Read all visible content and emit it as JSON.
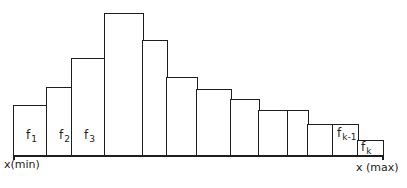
{
  "diagram": {
    "type": "histogram",
    "axis": {
      "left_label": "x(min)",
      "right_label": "x (max)"
    },
    "bars": [
      {
        "x0": 13,
        "x1": 46,
        "top": 105,
        "label": "f",
        "sub": "1"
      },
      {
        "x0": 46,
        "x1": 71,
        "top": 87,
        "label": "f",
        "sub": "2"
      },
      {
        "x0": 71,
        "x1": 104,
        "top": 58,
        "label": "f",
        "sub": "3"
      },
      {
        "x0": 104,
        "x1": 142,
        "top": 13,
        "label": "",
        "sub": ""
      },
      {
        "x0": 142,
        "x1": 166,
        "top": 40,
        "label": "",
        "sub": ""
      },
      {
        "x0": 166,
        "x1": 196,
        "top": 77,
        "label": "",
        "sub": ""
      },
      {
        "x0": 196,
        "x1": 230,
        "top": 89,
        "label": "",
        "sub": ""
      },
      {
        "x0": 230,
        "x1": 258,
        "top": 99,
        "label": "",
        "sub": ""
      },
      {
        "x0": 258,
        "x1": 287,
        "top": 110,
        "label": "",
        "sub": ""
      },
      {
        "x0": 287,
        "x1": 307,
        "top": 110,
        "label": "",
        "sub": ""
      },
      {
        "x0": 307,
        "x1": 332,
        "top": 124,
        "label": "",
        "sub": ""
      },
      {
        "x0": 332,
        "x1": 357,
        "top": 124,
        "label": "f",
        "sub": "k-1"
      },
      {
        "x0": 357,
        "x1": 382,
        "top": 140,
        "label": "f",
        "sub": "k"
      }
    ],
    "baseline_y": 155,
    "line_color": "#1e1e1e"
  }
}
